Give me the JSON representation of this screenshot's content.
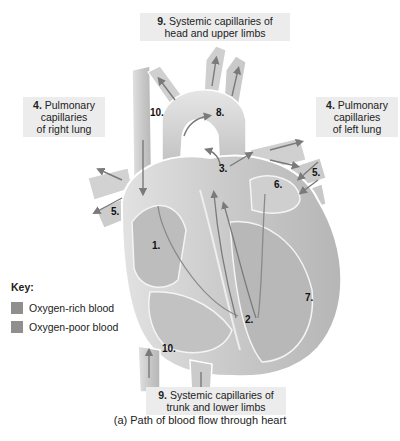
{
  "labels": {
    "top": {
      "num": "9.",
      "line1": "Systemic capillaries of",
      "line2": "head and upper limbs"
    },
    "right_lung": {
      "num": "4.",
      "line1": "Pulmonary",
      "line2": "capillaries",
      "line3": "of right lung"
    },
    "left_lung": {
      "num": "4.",
      "line1": "Pulmonary",
      "line2": "capillaries",
      "line3": "of left lung"
    },
    "bottom": {
      "num": "9.",
      "line1": "Systemic capillaries of",
      "line2": "trunk and lower limbs"
    }
  },
  "markers": {
    "m1": "1.",
    "m2": "2.",
    "m3": "3.",
    "m5_left": "5.",
    "m5_right": "5.",
    "m6": "6.",
    "m7": "7.",
    "m8": "8.",
    "m10_top": "10.",
    "m10_bottom": "10."
  },
  "key": {
    "title": "Key:",
    "items": [
      {
        "label": "Oxygen-rich blood",
        "color": "#8f8f8f"
      },
      {
        "label": "Oxygen-poor blood",
        "color": "#8f8f8f"
      }
    ]
  },
  "caption": "(a) Path of blood flow through heart",
  "colors": {
    "label_bg": "#ececec",
    "heart_fill": "#d4d4d4",
    "heart_dark": "#a8a8a8",
    "arrow": "#7a7a7a"
  }
}
